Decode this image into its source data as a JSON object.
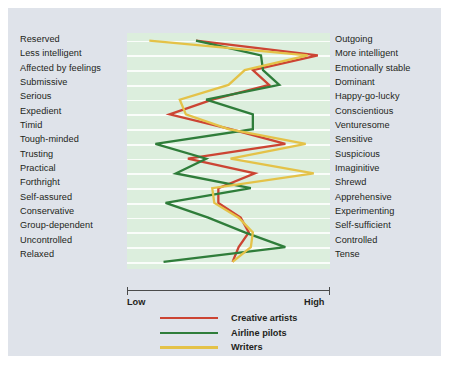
{
  "figure": {
    "background_color": "#dfe3ea",
    "plot_background_color": "#dceedd"
  },
  "axis": {
    "low_label": "Low",
    "high_label": "High"
  },
  "legend": {
    "items": [
      {
        "label": "Creative artists",
        "color": "#cc4433"
      },
      {
        "label": "Airline pilots",
        "color": "#2f7d3a"
      },
      {
        "label": "Writers",
        "color": "#e4c248"
      }
    ]
  },
  "chart_data": {
    "type": "line",
    "title": "",
    "subtitle": "",
    "xlabel": "",
    "ylabel": "",
    "orientation": "horizontal-profile",
    "xlim": [
      0,
      10
    ],
    "xtick_labels": [
      "Low",
      "High"
    ],
    "grid": true,
    "legend_position": "bottom",
    "left_labels": [
      "Reserved",
      "Less intelligent",
      "Affected by feelings",
      "Submissive",
      "Serious",
      "Expedient",
      "Timid",
      "Tough-minded",
      "Trusting",
      "Practical",
      "Forthright",
      "Self-assured",
      "Conservative",
      "Group-dependent",
      "Uncontrolled",
      "Relaxed"
    ],
    "right_labels": [
      "Outgoing",
      "More intelligent",
      "Emotionally stable",
      "Dominant",
      "Happy-go-lucky",
      "Conscientious",
      "Venturesome",
      "Sensitive",
      "Suspicious",
      "Imaginitive",
      "Shrewd",
      "Apprehensive",
      "Experimenting",
      "Self-sufficient",
      "Controlled",
      "Tense"
    ],
    "series": [
      {
        "name": "Creative artists",
        "color": "#cc4433",
        "values": [
          3.4,
          9.4,
          6.2,
          7.0,
          4.2,
          2.1,
          5.1,
          7.8,
          3.0,
          6.3,
          4.5,
          4.5,
          5.6,
          6.0,
          5.5,
          5.2
        ]
      },
      {
        "name": "Airline pilots",
        "color": "#2f7d3a",
        "values": [
          3.4,
          6.6,
          6.7,
          7.5,
          3.9,
          6.2,
          6.2,
          1.4,
          3.9,
          2.4,
          6.1,
          1.9,
          4.0,
          5.8,
          7.8,
          1.8
        ]
      },
      {
        "name": "Writers",
        "color": "#e4c248",
        "values": [
          1.1,
          8.9,
          5.8,
          5.0,
          2.6,
          2.9,
          5.0,
          8.8,
          5.1,
          9.2,
          4.2,
          4.3,
          5.5,
          6.2,
          6.1,
          5.2
        ]
      }
    ]
  }
}
